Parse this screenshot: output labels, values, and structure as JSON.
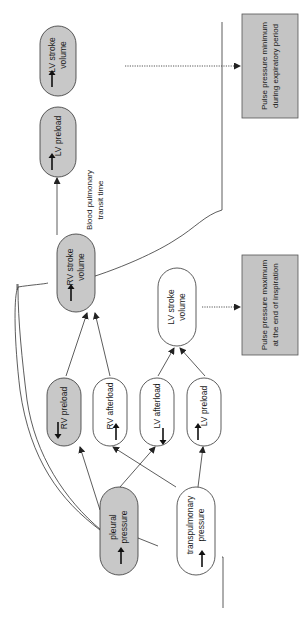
{
  "diagram": {
    "orientation": "rotated 90° counter-clockwise (text reads bottom-to-top)",
    "colors": {
      "gray_fill": "#c8c8c8",
      "white_fill": "#ffffff",
      "stroke": "#333333",
      "note_fill": "#c4c4c4"
    },
    "nodes": {
      "pleural_pressure": {
        "line1": "pleural",
        "line2": "pressure",
        "arrow": "up",
        "fill": "gray"
      },
      "transpulmonary_pressure": {
        "line1": "transpulmonary",
        "line2": "pressure",
        "arrow": "up",
        "fill": "white"
      },
      "rv_preload": {
        "line1": "RV preload",
        "arrow": "down",
        "fill": "gray"
      },
      "rv_afterload": {
        "line1": "RV afterload",
        "arrow": "up",
        "fill": "white"
      },
      "lv_afterload": {
        "line1": "LV afterload",
        "arrow": "down",
        "fill": "white"
      },
      "lv_preload_white": {
        "line1": "LV preload",
        "arrow": "up",
        "fill": "white"
      },
      "rv_stroke_volume": {
        "line1": "RV stroke",
        "line2": "volume",
        "arrow": "down",
        "fill": "gray"
      },
      "lv_stroke_volume_white": {
        "line1": "LV stroke",
        "line2": "volume",
        "arrow": "none",
        "fill": "white"
      },
      "lv_preload_gray": {
        "line1": "LV preload",
        "arrow": "down",
        "fill": "gray"
      },
      "lv_stroke_volume_gray": {
        "line1": "LV stroke",
        "line2": "volume",
        "arrow": "down",
        "fill": "gray"
      }
    },
    "edge_labels": {
      "transit": {
        "line1": "Blood pulmonary",
        "line2": "transit time"
      }
    },
    "notes": {
      "max": {
        "line1": "Pulse pressure maximum",
        "line2": "at the end of inspiration"
      },
      "min": {
        "line1": "Pulse pressure minimum",
        "line2": "during expiratory period"
      }
    }
  }
}
